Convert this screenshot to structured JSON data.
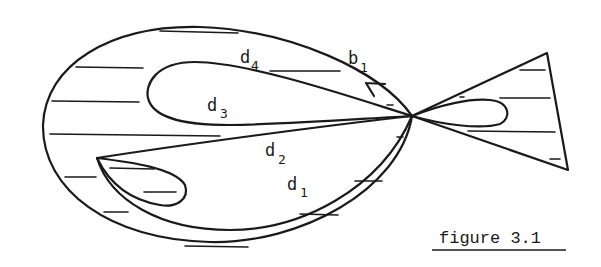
{
  "diagram": {
    "labels": {
      "d4": {
        "base": "d",
        "sub": "4"
      },
      "b1": {
        "base": "b",
        "sub": "1"
      },
      "d3": {
        "base": "d",
        "sub": "3"
      },
      "d2": {
        "base": "d",
        "sub": "2"
      },
      "d1": {
        "base": "d",
        "sub": "1"
      }
    },
    "caption": "figure 3.1",
    "colors": {
      "ink": "#1a1a1a",
      "background": "#ffffff"
    }
  }
}
